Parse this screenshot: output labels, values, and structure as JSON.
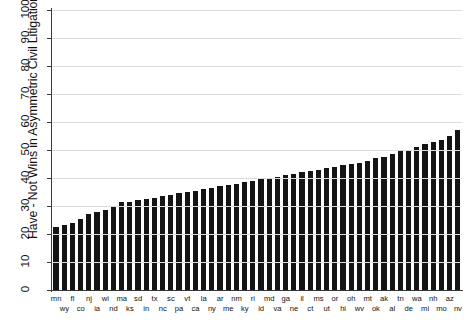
{
  "chart_data": {
    "type": "bar",
    "title": "",
    "xlabel": "",
    "ylabel": "Have - Not Wins in Asymmetric Civil Litigation",
    "ylim": [
      0,
      100
    ],
    "ytick_labels": [
      "0",
      "10",
      "20",
      "30",
      "40",
      "50",
      "60",
      "70",
      "80",
      "90",
      "100"
    ],
    "ytick_values": [
      0,
      10,
      20,
      30,
      40,
      50,
      60,
      70,
      80,
      90,
      100
    ],
    "grid": "horizontal",
    "legend": "none",
    "bar_color": "#141414",
    "categories": [
      "mn",
      "wy",
      "fl",
      "co",
      "nj",
      "ia",
      "wi",
      "nd",
      "ma",
      "ks",
      "sd",
      "in",
      "tx",
      "nc",
      "sc",
      "pa",
      "vt",
      "ca",
      "la",
      "ny",
      "ar",
      "me",
      "nm",
      "ky",
      "ri",
      "id",
      "md",
      "va",
      "ga",
      "ne",
      "il",
      "ct",
      "ms",
      "ut",
      "or",
      "hi",
      "oh",
      "wv",
      "mt",
      "ok",
      "ak",
      "al",
      "tn",
      "de",
      "wa",
      "mi",
      "nh",
      "mo",
      "az",
      "nv"
    ],
    "values": [
      22.5,
      23.2,
      23.8,
      25.5,
      27.0,
      28.0,
      28.5,
      29.5,
      31.5,
      31.5,
      32.0,
      32.5,
      33.0,
      33.5,
      34.0,
      34.5,
      35.0,
      35.5,
      36.0,
      36.5,
      37.0,
      37.5,
      38.0,
      38.5,
      39.0,
      39.5,
      40.0,
      40.5,
      41.0,
      41.5,
      42.0,
      42.5,
      43.0,
      43.5,
      44.0,
      44.5,
      45.0,
      45.5,
      46.0,
      47.0,
      47.5,
      48.5,
      49.5,
      50.0,
      51.0,
      52.0,
      53.0,
      53.5,
      55.0,
      57.0
    ],
    "bar_count": 50
  }
}
